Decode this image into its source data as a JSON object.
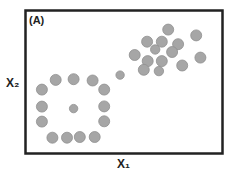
{
  "panel_label": "(A)",
  "chart_data": {
    "type": "scatter",
    "title": "(A)",
    "xlabel": "X₁",
    "ylabel": "X₂",
    "xlim": [
      0,
      100
    ],
    "ylim": [
      0,
      100
    ],
    "grid": false,
    "series": [
      {
        "name": "ring-cluster",
        "color": "#a6a6a6",
        "points": [
          {
            "x": 14.8,
            "y": 51.5,
            "size": "large"
          },
          {
            "x": 24.0,
            "y": 52.0,
            "size": "large"
          },
          {
            "x": 33.8,
            "y": 51.1,
            "size": "large"
          },
          {
            "x": 39.8,
            "y": 44.6,
            "size": "large"
          },
          {
            "x": 7.7,
            "y": 44.6,
            "size": "large"
          },
          {
            "x": 7.7,
            "y": 32.4,
            "size": "large"
          },
          {
            "x": 24.0,
            "y": 31.0,
            "size": "small"
          },
          {
            "x": 39.8,
            "y": 32.6,
            "size": "large"
          },
          {
            "x": 7.7,
            "y": 21.7,
            "size": "large"
          },
          {
            "x": 39.8,
            "y": 21.9,
            "size": "large"
          },
          {
            "x": 13.1,
            "y": 10.2,
            "size": "large"
          },
          {
            "x": 20.6,
            "y": 10.2,
            "size": "large"
          },
          {
            "x": 27.2,
            "y": 10.7,
            "size": "large"
          },
          {
            "x": 34.9,
            "y": 10.7,
            "size": "large"
          }
        ]
      },
      {
        "name": "bridge-point",
        "color": "#a6a6a6",
        "points": [
          {
            "x": 48.0,
            "y": 54.9,
            "size": "small"
          }
        ]
      },
      {
        "name": "upper-cluster",
        "color": "#a6a6a6",
        "points": [
          {
            "x": 72.8,
            "y": 87.4,
            "size": "large"
          },
          {
            "x": 61.9,
            "y": 78.8,
            "size": "large"
          },
          {
            "x": 69.5,
            "y": 78.8,
            "size": "large"
          },
          {
            "x": 77.9,
            "y": 77.0,
            "size": "large"
          },
          {
            "x": 87.2,
            "y": 83.3,
            "size": "large"
          },
          {
            "x": 66.1,
            "y": 73.2,
            "size": "medium"
          },
          {
            "x": 74.8,
            "y": 71.4,
            "size": "large"
          },
          {
            "x": 55.5,
            "y": 69.3,
            "size": "large"
          },
          {
            "x": 62.2,
            "y": 64.9,
            "size": "large"
          },
          {
            "x": 69.5,
            "y": 64.9,
            "size": "large"
          },
          {
            "x": 89.4,
            "y": 67.4,
            "size": "large"
          },
          {
            "x": 60.2,
            "y": 58.7,
            "size": "large"
          },
          {
            "x": 68.0,
            "y": 57.8,
            "size": "medium"
          },
          {
            "x": 80.0,
            "y": 61.8,
            "size": "large"
          }
        ]
      }
    ]
  }
}
